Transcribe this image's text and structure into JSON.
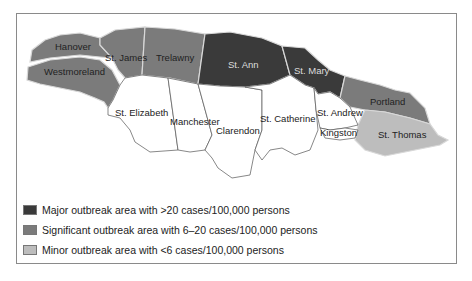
{
  "map": {
    "colors": {
      "major": "#3a3a3a",
      "significant": "#7b7b7b",
      "minor": "#bdbdbd",
      "none": "#ffffff",
      "border": "#d8d8d8",
      "outline": "#555555"
    },
    "parishes": [
      {
        "name": "Hanover",
        "category": "significant"
      },
      {
        "name": "St. James",
        "category": "significant"
      },
      {
        "name": "Trelawny",
        "category": "significant"
      },
      {
        "name": "Westmoreland",
        "category": "significant"
      },
      {
        "name": "St. Ann",
        "category": "major"
      },
      {
        "name": "St. Mary",
        "category": "major"
      },
      {
        "name": "Portland",
        "category": "significant"
      },
      {
        "name": "St. Elizabeth",
        "category": "none"
      },
      {
        "name": "Manchester",
        "category": "none"
      },
      {
        "name": "Clarendon",
        "category": "none"
      },
      {
        "name": "St. Catherine",
        "category": "none"
      },
      {
        "name": "St. Andrew",
        "category": "none"
      },
      {
        "name": "Kingston",
        "category": "none"
      },
      {
        "name": "St. Thomas",
        "category": "minor"
      }
    ]
  },
  "legend": [
    {
      "category": "major",
      "label": "Major outbreak area with >20 cases/100,000 persons"
    },
    {
      "category": "significant",
      "label": "Significant outbreak area with 6–20 cases/100,000 persons"
    },
    {
      "category": "minor",
      "label": "Minor outbreak area with <6 cases/100,000 persons"
    }
  ]
}
